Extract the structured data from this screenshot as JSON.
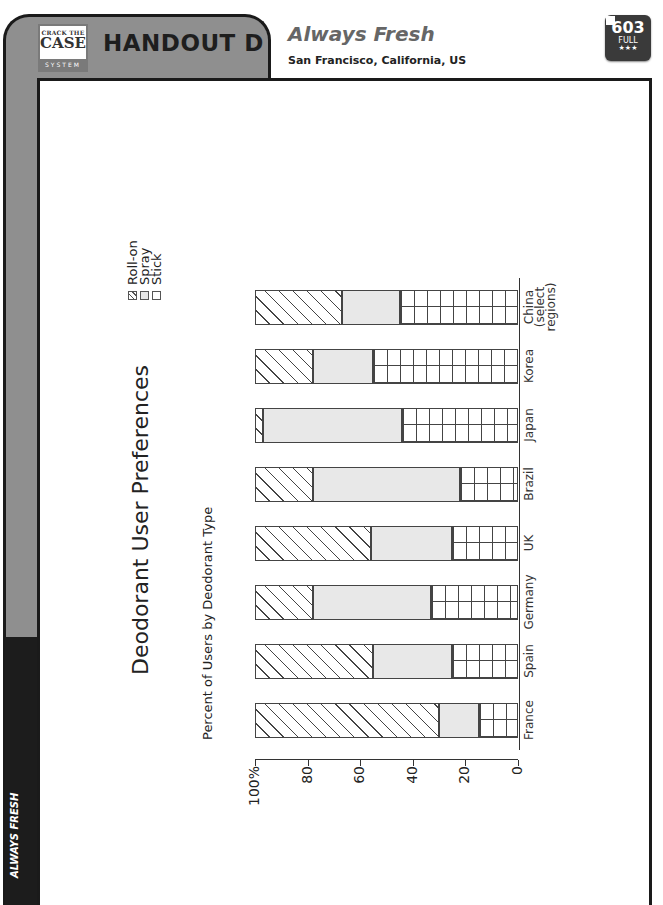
{
  "header": {
    "logo": {
      "line1": "CRACK THE",
      "line2": "CASE",
      "line3": "SYSTEM"
    },
    "handout_label": "HANDOUT D",
    "case_title": "Always Fresh",
    "case_location": "San Francisco, California, US",
    "badge": {
      "number": "603",
      "level": "FULL",
      "stars": "★★★"
    }
  },
  "sidebar": {
    "label": "ALWAYS FRESH"
  },
  "colors": {
    "frame_gray": "#8f8f8f",
    "frame_dark": "#1c1c1c",
    "spray_fill": "#e8e8e8"
  },
  "chart_data": {
    "type": "bar",
    "stacked": true,
    "orientation": "rotated-90-ccw",
    "title": "Deodorant User Preferences",
    "ylabel": "Percent of Users by Deodorant Type",
    "xlabel": "",
    "ylim": [
      0,
      100
    ],
    "y_ticks": [
      "0",
      "20",
      "40",
      "60",
      "80",
      "100%"
    ],
    "categories": [
      "France",
      "Spain",
      "Germany",
      "UK",
      "Brazil",
      "Japan",
      "Korea",
      "China (select regions)"
    ],
    "series": [
      {
        "name": "Stick",
        "pattern": "grid",
        "values": [
          15,
          25,
          33,
          25,
          22,
          44,
          55,
          45
        ]
      },
      {
        "name": "Spray",
        "pattern": "light-gray",
        "values": [
          15,
          30,
          45,
          31,
          56,
          53,
          23,
          22
        ]
      },
      {
        "name": "Roll-on",
        "pattern": "diagonal-hatch",
        "values": [
          70,
          45,
          22,
          44,
          22,
          3,
          22,
          33
        ]
      }
    ],
    "legend": [
      "Roll-on",
      "Spray",
      "Stick"
    ],
    "legend_position": "top-right",
    "grid": false
  }
}
